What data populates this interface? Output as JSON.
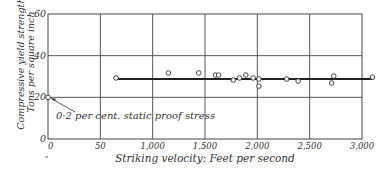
{
  "chart_data": {
    "type": "scatter",
    "title": "",
    "xlabel": "Striking velocity: Feet per second",
    "ylabel": [
      "Compressive yield strength:",
      "Tons per square inch"
    ],
    "xlim": [
      0,
      3000
    ],
    "ylim": [
      0,
      60
    ],
    "x_ticks": [
      0,
      500,
      1000,
      1500,
      2000,
      2500,
      3000
    ],
    "x_tick_labels": [
      "0",
      "50",
      "1,000",
      "1,500",
      "2,000",
      "2,500",
      "3,000"
    ],
    "y_ticks": [
      0,
      20,
      40,
      60
    ],
    "y_tick_labels": [
      "0",
      "20",
      "40",
      "60"
    ],
    "grid": true,
    "legend": null,
    "series": [
      {
        "name": "Dynamic compressive yield strength",
        "marker": "open-circle",
        "points": [
          {
            "x": 650,
            "y": 29.3
          },
          {
            "x": 1150,
            "y": 31.7
          },
          {
            "x": 1440,
            "y": 31.7
          },
          {
            "x": 1600,
            "y": 30.7
          },
          {
            "x": 1630,
            "y": 30.7
          },
          {
            "x": 1770,
            "y": 28.3
          },
          {
            "x": 1830,
            "y": 29.3
          },
          {
            "x": 1890,
            "y": 30.7
          },
          {
            "x": 1960,
            "y": 29.3
          },
          {
            "x": 2015,
            "y": 28.8
          },
          {
            "x": 2015,
            "y": 25.4
          },
          {
            "x": 2280,
            "y": 28.8
          },
          {
            "x": 2390,
            "y": 27.8
          },
          {
            "x": 2710,
            "y": 26.9
          },
          {
            "x": 2730,
            "y": 30.2
          },
          {
            "x": 3100,
            "y": 29.7
          }
        ]
      },
      {
        "name": "Static proof stress",
        "marker": "open-circle",
        "points": [
          {
            "x": 0,
            "y": 20
          }
        ]
      }
    ],
    "fit_line": {
      "x_start": 650,
      "x_end": 3100,
      "y": 28.8
    },
    "annotations": [
      {
        "text": "0·2 per cent. static proof stress",
        "points_to": {
          "x": 0,
          "y": 20
        }
      }
    ],
    "footnote_mark": "*"
  }
}
